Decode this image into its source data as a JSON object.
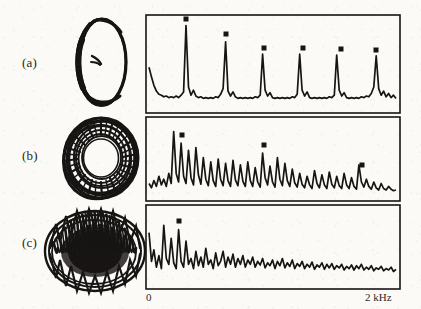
{
  "figure": {
    "background_color": "#fbfaf7",
    "ink_color": "#171513",
    "rows": [
      {
        "label": "(a)",
        "portrait_name": "limit-cycle-orbit",
        "regime": "periodic"
      },
      {
        "label": "(b)",
        "portrait_name": "torus-attractor",
        "regime": "quasiperiodic"
      },
      {
        "label": "(c)",
        "portrait_name": "chaotic-attractor",
        "regime": "chaotic"
      }
    ]
  },
  "axis": {
    "left_tick_label": "0",
    "right_tick_label": "2 kHz",
    "xlabel": "",
    "ylabel": ""
  },
  "chart_data": [
    {
      "type": "line",
      "panel": "(a)",
      "title": "",
      "xlabel": "",
      "ylabel": "",
      "xlim": [
        0,
        2
      ],
      "ylim": [
        0,
        1
      ],
      "grid": false,
      "legend": "none",
      "tick_labels": [
        "0",
        "2 kHz"
      ],
      "annotations": [
        "square markers cap each harmonic peak"
      ],
      "peaks_khz": [
        0.3,
        0.61,
        0.92,
        1.22,
        1.53,
        1.84
      ],
      "peak_heights": [
        0.97,
        0.77,
        0.62,
        0.62,
        0.61,
        0.6
      ],
      "noise_floor": 0.07,
      "x": [
        0.0,
        0.02,
        0.04,
        0.06,
        0.08,
        0.1,
        0.12,
        0.14,
        0.16,
        0.18,
        0.2,
        0.22,
        0.24,
        0.26,
        0.28,
        0.3,
        0.32,
        0.34,
        0.36,
        0.38,
        0.4,
        0.42,
        0.44,
        0.46,
        0.48,
        0.5,
        0.52,
        0.54,
        0.56,
        0.58,
        0.6,
        0.62,
        0.64,
        0.66,
        0.68,
        0.7,
        0.72,
        0.74,
        0.76,
        0.78,
        0.8,
        0.82,
        0.84,
        0.86,
        0.88,
        0.9,
        0.92,
        0.94,
        0.96,
        0.98,
        1.0,
        1.02,
        1.04,
        1.06,
        1.08,
        1.1,
        1.12,
        1.14,
        1.16,
        1.18,
        1.2,
        1.22,
        1.24,
        1.26,
        1.28,
        1.3,
        1.32,
        1.34,
        1.36,
        1.38,
        1.4,
        1.42,
        1.44,
        1.46,
        1.48,
        1.5,
        1.52,
        1.54,
        1.56,
        1.58,
        1.6,
        1.62,
        1.64,
        1.66,
        1.68,
        1.7,
        1.72,
        1.74,
        1.76,
        1.78,
        1.8,
        1.82,
        1.84,
        1.86,
        1.88,
        1.9,
        1.92,
        1.94,
        1.96,
        1.98,
        2.0
      ],
      "y": [
        0.46,
        0.34,
        0.24,
        0.17,
        0.13,
        0.12,
        0.1,
        0.11,
        0.09,
        0.1,
        0.09,
        0.11,
        0.09,
        0.12,
        0.16,
        0.97,
        0.22,
        0.12,
        0.18,
        0.11,
        0.09,
        0.1,
        0.08,
        0.09,
        0.08,
        0.09,
        0.08,
        0.1,
        0.09,
        0.13,
        0.2,
        0.77,
        0.17,
        0.11,
        0.16,
        0.1,
        0.08,
        0.09,
        0.08,
        0.09,
        0.08,
        0.09,
        0.08,
        0.1,
        0.09,
        0.12,
        0.62,
        0.18,
        0.11,
        0.15,
        0.09,
        0.08,
        0.09,
        0.08,
        0.09,
        0.08,
        0.09,
        0.08,
        0.1,
        0.09,
        0.13,
        0.62,
        0.18,
        0.11,
        0.16,
        0.09,
        0.08,
        0.09,
        0.08,
        0.09,
        0.08,
        0.09,
        0.08,
        0.1,
        0.09,
        0.12,
        0.61,
        0.18,
        0.11,
        0.15,
        0.09,
        0.08,
        0.09,
        0.08,
        0.09,
        0.08,
        0.1,
        0.09,
        0.11,
        0.1,
        0.14,
        0.22,
        0.6,
        0.2,
        0.12,
        0.17,
        0.1,
        0.14,
        0.09,
        0.12,
        0.08
      ]
    },
    {
      "type": "line",
      "panel": "(b)",
      "title": "",
      "xlabel": "",
      "ylabel": "",
      "xlim": [
        0,
        2
      ],
      "ylim": [
        0,
        1
      ],
      "grid": false,
      "legend": "none",
      "annotations": [
        "dense quasi-periodic comb decaying toward high frequency",
        "square markers on three tallest peaks"
      ],
      "marked_peaks_khz": [
        0.38,
        1.03,
        1.55
      ],
      "x": [
        0.0,
        0.02,
        0.04,
        0.06,
        0.08,
        0.1,
        0.12,
        0.14,
        0.16,
        0.18,
        0.2,
        0.22,
        0.24,
        0.26,
        0.28,
        0.3,
        0.32,
        0.34,
        0.36,
        0.38,
        0.4,
        0.42,
        0.44,
        0.46,
        0.48,
        0.5,
        0.52,
        0.54,
        0.56,
        0.58,
        0.6,
        0.62,
        0.64,
        0.66,
        0.68,
        0.7,
        0.72,
        0.74,
        0.76,
        0.78,
        0.8,
        0.82,
        0.84,
        0.86,
        0.88,
        0.9,
        0.92,
        0.94,
        0.96,
        0.98,
        1.0,
        1.02,
        1.04,
        1.06,
        1.08,
        1.1,
        1.12,
        1.14,
        1.16,
        1.18,
        1.2,
        1.22,
        1.24,
        1.26,
        1.28,
        1.3,
        1.32,
        1.34,
        1.36,
        1.38,
        1.4,
        1.42,
        1.44,
        1.46,
        1.48,
        1.5,
        1.52,
        1.54,
        1.56,
        1.58,
        1.6,
        1.62,
        1.64,
        1.66,
        1.68,
        1.7,
        1.72,
        1.74,
        1.76,
        1.78,
        1.8,
        1.82,
        1.84,
        1.86,
        1.88,
        1.9,
        1.92,
        1.94,
        1.96,
        1.98,
        2.0
      ],
      "y": [
        0.16,
        0.1,
        0.2,
        0.12,
        0.26,
        0.14,
        0.22,
        0.12,
        0.3,
        0.16,
        0.88,
        0.3,
        0.18,
        0.72,
        0.26,
        0.16,
        0.62,
        0.24,
        0.14,
        0.66,
        0.28,
        0.15,
        0.52,
        0.22,
        0.13,
        0.46,
        0.2,
        0.12,
        0.5,
        0.22,
        0.13,
        0.44,
        0.2,
        0.12,
        0.48,
        0.21,
        0.13,
        0.42,
        0.19,
        0.12,
        0.46,
        0.2,
        0.12,
        0.38,
        0.18,
        0.11,
        0.58,
        0.24,
        0.14,
        0.4,
        0.18,
        0.11,
        0.52,
        0.22,
        0.13,
        0.44,
        0.2,
        0.12,
        0.36,
        0.17,
        0.11,
        0.3,
        0.15,
        0.1,
        0.26,
        0.14,
        0.09,
        0.34,
        0.16,
        0.1,
        0.28,
        0.14,
        0.09,
        0.32,
        0.15,
        0.1,
        0.26,
        0.13,
        0.09,
        0.3,
        0.14,
        0.09,
        0.24,
        0.12,
        0.08,
        0.42,
        0.18,
        0.11,
        0.22,
        0.12,
        0.08,
        0.18,
        0.1,
        0.07,
        0.16,
        0.09,
        0.07,
        0.12,
        0.08,
        0.06,
        0.07
      ]
    },
    {
      "type": "line",
      "panel": "(c)",
      "title": "",
      "xlabel": "",
      "ylabel": "",
      "xlim": [
        0,
        2
      ],
      "ylim": [
        0,
        1
      ],
      "grid": false,
      "legend": "none",
      "annotations": [
        "broadband chaotic spectrum",
        "square marker on tallest low-frequency peak"
      ],
      "marked_peaks_khz": [
        0.3
      ],
      "x": [
        0.0,
        0.02,
        0.04,
        0.06,
        0.08,
        0.1,
        0.12,
        0.14,
        0.16,
        0.18,
        0.2,
        0.22,
        0.24,
        0.26,
        0.28,
        0.3,
        0.32,
        0.34,
        0.36,
        0.38,
        0.4,
        0.42,
        0.44,
        0.46,
        0.48,
        0.5,
        0.52,
        0.54,
        0.56,
        0.58,
        0.6,
        0.62,
        0.64,
        0.66,
        0.68,
        0.7,
        0.72,
        0.74,
        0.76,
        0.78,
        0.8,
        0.82,
        0.84,
        0.86,
        0.88,
        0.9,
        0.92,
        0.94,
        0.96,
        0.98,
        1.0,
        1.02,
        1.04,
        1.06,
        1.08,
        1.1,
        1.12,
        1.14,
        1.16,
        1.18,
        1.2,
        1.22,
        1.24,
        1.26,
        1.28,
        1.3,
        1.32,
        1.34,
        1.36,
        1.38,
        1.4,
        1.42,
        1.44,
        1.46,
        1.48,
        1.5,
        1.52,
        1.54,
        1.56,
        1.58,
        1.6,
        1.62,
        1.64,
        1.66,
        1.68,
        1.7,
        1.72,
        1.74,
        1.76,
        1.78,
        1.8,
        1.82,
        1.84,
        1.86,
        1.88,
        1.9,
        1.92,
        1.94,
        1.96,
        1.98,
        2.0
      ],
      "y": [
        0.7,
        0.3,
        0.46,
        0.22,
        0.38,
        0.2,
        0.8,
        0.34,
        0.26,
        0.62,
        0.28,
        0.2,
        0.74,
        0.3,
        0.22,
        0.58,
        0.26,
        0.34,
        0.2,
        0.44,
        0.24,
        0.36,
        0.22,
        0.48,
        0.26,
        0.32,
        0.2,
        0.42,
        0.24,
        0.3,
        0.44,
        0.22,
        0.36,
        0.26,
        0.4,
        0.22,
        0.34,
        0.26,
        0.38,
        0.22,
        0.32,
        0.26,
        0.36,
        0.22,
        0.3,
        0.25,
        0.34,
        0.21,
        0.28,
        0.24,
        0.32,
        0.2,
        0.3,
        0.24,
        0.34,
        0.21,
        0.28,
        0.23,
        0.32,
        0.2,
        0.27,
        0.23,
        0.3,
        0.2,
        0.26,
        0.22,
        0.29,
        0.19,
        0.25,
        0.22,
        0.28,
        0.19,
        0.26,
        0.21,
        0.27,
        0.19,
        0.24,
        0.21,
        0.26,
        0.18,
        0.23,
        0.2,
        0.25,
        0.18,
        0.24,
        0.2,
        0.26,
        0.18,
        0.22,
        0.19,
        0.24,
        0.17,
        0.21,
        0.19,
        0.23,
        0.17,
        0.2,
        0.18,
        0.22,
        0.16,
        0.19
      ]
    }
  ]
}
